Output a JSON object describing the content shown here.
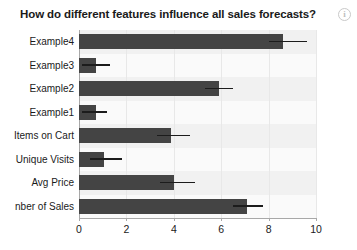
{
  "header": {
    "title": "How do different features influence all sales forecasts?",
    "info_icon": "info-icon",
    "info_glyph": "i"
  },
  "colors": {
    "bar": "#444444",
    "error_bar": "#1c1c1c",
    "plot_background": "#fbfbfb",
    "band": "#f1f1f1",
    "axis": "#a8a8a8",
    "text": "#1a1a1a",
    "info_icon_border": "#c9c9c9"
  },
  "chart_data": {
    "type": "bar",
    "orientation": "horizontal",
    "title": "How do different features influence all sales forecasts?",
    "xlabel": "",
    "ylabel": "",
    "xlim": [
      0,
      10
    ],
    "ylim": null,
    "grid": true,
    "legend": null,
    "xticks": [
      0,
      2,
      4,
      6,
      8,
      10
    ],
    "xtick_labels": [
      "0",
      "2",
      "4",
      "6",
      "8",
      "10"
    ],
    "categories": [
      "Example4",
      "Example3",
      "Example2",
      "Example1",
      "Items on Cart",
      "Unique Visits",
      "Avg Price",
      "nber of Sales"
    ],
    "values": [
      8.6,
      0.72,
      5.9,
      0.72,
      3.9,
      1.05,
      4.0,
      7.1
    ],
    "error_high": [
      9.6,
      1.3,
      6.5,
      1.2,
      4.7,
      1.8,
      4.9,
      7.75
    ],
    "bars": [
      {
        "label": "Example4",
        "value": 8.6,
        "error_high": 9.6
      },
      {
        "label": "Example3",
        "value": 0.72,
        "error_high": 1.3
      },
      {
        "label": "Example2",
        "value": 5.9,
        "error_high": 6.5
      },
      {
        "label": "Example1",
        "value": 0.72,
        "error_high": 1.2
      },
      {
        "label": "Items on Cart",
        "value": 3.9,
        "error_high": 4.7
      },
      {
        "label": "Unique Visits",
        "value": 1.05,
        "error_high": 1.8
      },
      {
        "label": "Avg Price",
        "value": 4.0,
        "error_high": 4.9
      },
      {
        "label": "nber of Sales",
        "value": 7.1,
        "error_high": 7.75
      }
    ]
  }
}
